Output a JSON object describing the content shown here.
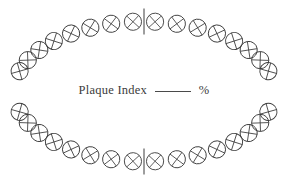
{
  "document": {
    "title": "Plaque Index Chart",
    "background_color": "#ffffff",
    "ink_color": "#3c3c3c",
    "width": 288,
    "height": 193
  },
  "label": {
    "text": "Plaque Index",
    "blank_placeholder": "",
    "percent_symbol": "%",
    "full_text": "Plaque Index ______ %"
  },
  "chart_data": {
    "type": "diagram",
    "subtype": "dental-arch-odontogram",
    "title": "Plaque Index",
    "total_teeth": 32,
    "arches": [
      {
        "name": "upper",
        "label": "maxillary",
        "tooth_count": 16,
        "quadrants": [
          {
            "name": "upper-right",
            "tooth_count": 8
          },
          {
            "name": "upper-left",
            "tooth_count": 8
          }
        ]
      },
      {
        "name": "lower",
        "label": "mandibular",
        "tooth_count": 16,
        "quadrants": [
          {
            "name": "lower-right",
            "tooth_count": 8
          },
          {
            "name": "lower-left",
            "tooth_count": 8
          }
        ]
      }
    ],
    "geometry": {
      "center_x": 144,
      "center_y": 91.5,
      "radius_x": 130,
      "radius_y": 70,
      "tooth_radius": 8.6,
      "angle_span_degrees": 156,
      "teeth_per_quadrant": 8
    },
    "midline": {
      "present": true,
      "positions": [
        "top",
        "bottom"
      ],
      "length": 26
    },
    "marks": {
      "tooth_glyph": "circle-with-cross",
      "cross_rotates_with_arch": true,
      "filled_surfaces": 0
    }
  }
}
